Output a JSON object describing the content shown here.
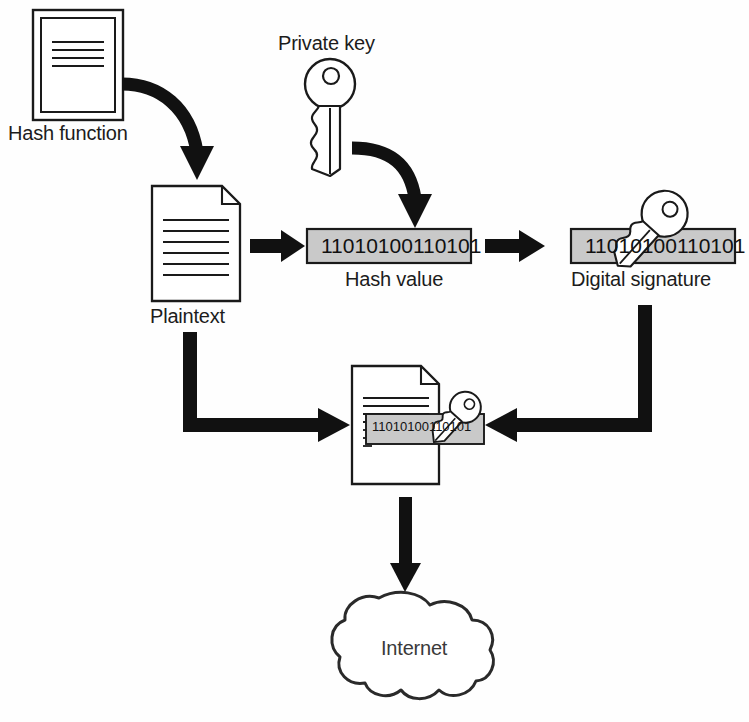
{
  "diagram": {
    "type": "flow-diagram",
    "background_color": "#ffffff",
    "line_color": "#1a1a1a",
    "box_fill_color": "#c9c9c9",
    "arrow_color": "#111111"
  },
  "labels": {
    "hash_function": "Hash function",
    "private_key": "Private key",
    "plaintext": "Plaintext",
    "hash_value": "Hash value",
    "digital_signature": "Digital signature",
    "internet": "Internet"
  },
  "values": {
    "hash_binary": "11010100110101",
    "signature_binary": "11010100110101",
    "document_signature_binary": "11010100110101"
  },
  "nodes": [
    {
      "id": "hash-function-doc",
      "label": "Hash function",
      "shape": "framed-document",
      "x": 33,
      "y": 10,
      "w": 90,
      "h": 110
    },
    {
      "id": "private-key",
      "label": "Private key",
      "shape": "key",
      "x": 305,
      "y": 60,
      "w": 52,
      "h": 115
    },
    {
      "id": "plaintext-doc",
      "label": "Plaintext",
      "shape": "document-folded-corner",
      "x": 152,
      "y": 186,
      "w": 88,
      "h": 115
    },
    {
      "id": "hash-value-box",
      "label": "Hash value",
      "shape": "filled-rectangle",
      "x": 307,
      "y": 229,
      "w": 164,
      "h": 34
    },
    {
      "id": "digital-signature-box",
      "label": "Digital signature",
      "shape": "filled-rectangle-with-key",
      "x": 571,
      "y": 229,
      "w": 164,
      "h": 34
    },
    {
      "id": "signed-document",
      "label": "",
      "shape": "document-with-signature-and-key",
      "x": 352,
      "y": 366,
      "w": 92,
      "h": 118
    },
    {
      "id": "internet-cloud",
      "label": "Internet",
      "shape": "cloud",
      "x": 333,
      "y": 591,
      "w": 150,
      "h": 118
    }
  ],
  "edges": [
    {
      "id": "edge-hashfn-to-plaintext",
      "from": "hash-function-doc",
      "to": "plaintext-doc",
      "style": "curved-arrow"
    },
    {
      "id": "edge-privatekey-to-hashvalue",
      "from": "private-key",
      "to": "hash-value-box",
      "style": "curved-arrow"
    },
    {
      "id": "edge-plaintext-to-hashvalue",
      "from": "plaintext-doc",
      "to": "hash-value-box",
      "style": "straight-arrow-right"
    },
    {
      "id": "edge-hashvalue-to-signature",
      "from": "hash-value-box",
      "to": "digital-signature-box",
      "style": "straight-arrow-right"
    },
    {
      "id": "edge-plaintext-to-signeddoc",
      "from": "plaintext-doc",
      "to": "signed-document",
      "style": "elbow-arrow-down-right"
    },
    {
      "id": "edge-signature-to-signeddoc",
      "from": "digital-signature-box",
      "to": "signed-document",
      "style": "elbow-arrow-down-left"
    },
    {
      "id": "edge-signeddoc-to-internet",
      "from": "signed-document",
      "to": "internet-cloud",
      "style": "straight-arrow-down"
    }
  ]
}
